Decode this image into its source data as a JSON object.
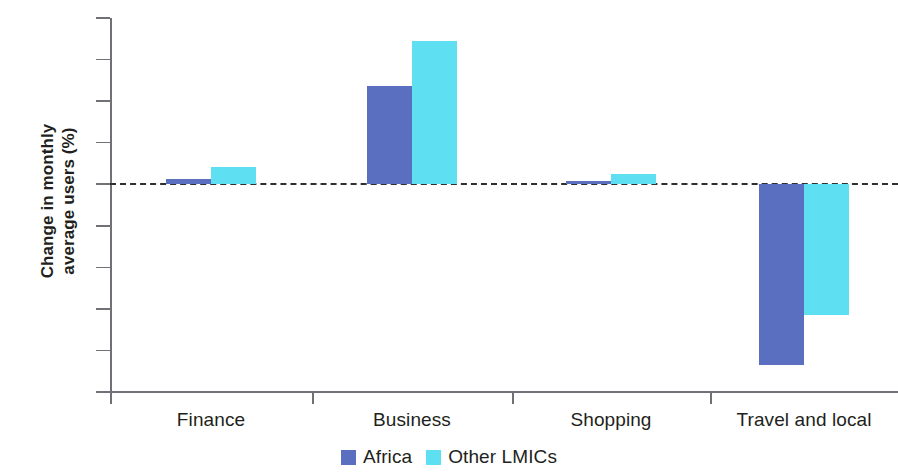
{
  "chart_data": {
    "type": "bar",
    "title": "",
    "subtitle": "",
    "xlabel": "",
    "ylabel": "Change in monthly average users (%)",
    "ylabel_lines": [
      "Change in monthly",
      "average users (%)"
    ],
    "categories": [
      "Finance",
      "Business",
      "Shopping",
      "Travel and local"
    ],
    "series": [
      {
        "name": "Africa",
        "color": "#5b6fc0",
        "values": [
          0.25,
          4.75,
          0.15,
          -8.7
        ]
      },
      {
        "name": "Other LMICs",
        "color": "#5fe0f2",
        "values": [
          0.85,
          6.9,
          0.5,
          -6.3
        ]
      }
    ],
    "ylim": [
      -10,
      8
    ],
    "yticks": [
      8,
      6,
      4,
      2,
      0,
      -2,
      -4,
      -6,
      -8,
      -10
    ],
    "ytick_labels": [
      "8",
      "6",
      "4",
      "2",
      "0",
      "-2",
      "-4",
      "-6",
      "-8",
      "-10"
    ],
    "grid": false,
    "zero_line": true,
    "zero_line_style": "dashed",
    "legend_position": "bottom-center"
  },
  "legend": {
    "items": [
      {
        "label": "Africa",
        "color": "#5b6fc0"
      },
      {
        "label": "Other LMICs",
        "color": "#5fe0f2"
      }
    ]
  }
}
